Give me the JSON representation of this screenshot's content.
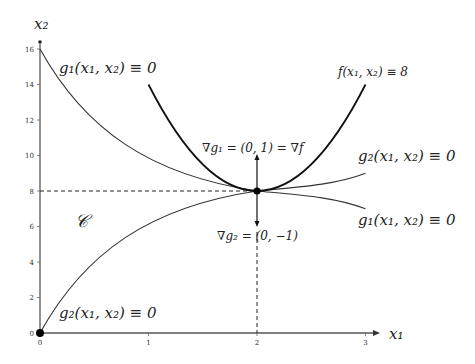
{
  "axes": {
    "x_label": "x₁",
    "y_label": "x₂",
    "x_ticks": [
      "0",
      "1",
      "2",
      "3"
    ],
    "y_ticks": [
      "0",
      "2",
      "4",
      "6",
      "8",
      "10",
      "12",
      "14",
      "16"
    ],
    "x_range": [
      0,
      3.1
    ],
    "y_range": [
      0,
      16.4
    ]
  },
  "labels": {
    "g1_top": "g₁(x₁, x₂) ≡ 0",
    "g2_bottom": "g₂(x₁, x₂) ≡ 0",
    "f_level": "f(x₁, x₂) ≡ 8",
    "g2_right": "g₂(x₁, x₂) ≡ 0",
    "g1_right": "g₁(x₁, x₂) ≡ 0",
    "grad_g1": "∇g₁ = (0, 1) = ∇f",
    "grad_g2": "∇g₂ = (0, −1)",
    "feasible_set": "𝒞"
  },
  "curves": [
    {
      "name": "g1",
      "equation": "x2 = 8 - (x1-2)^3",
      "x_from": 0,
      "x_to": 3
    },
    {
      "name": "g2",
      "equation": "x2 = 8 + (x1-2)^3",
      "x_from": 0,
      "x_to": 3
    },
    {
      "name": "f",
      "equation": "x2 = 8 + 6(x1-2)^2",
      "x_from": 1,
      "x_to": 3
    }
  ],
  "points": [
    {
      "name": "optimum",
      "x": 2,
      "y": 8
    },
    {
      "name": "origin",
      "x": 0,
      "y": 0
    }
  ],
  "vectors": [
    {
      "name": "grad_g1",
      "from": [
        2,
        8
      ],
      "dir": [
        0,
        1
      ]
    },
    {
      "name": "grad_g2",
      "from": [
        2,
        8
      ],
      "dir": [
        0,
        -1
      ]
    }
  ],
  "colors": {
    "axis": "#555555",
    "curve": "#333333",
    "f_curve": "#111111"
  }
}
